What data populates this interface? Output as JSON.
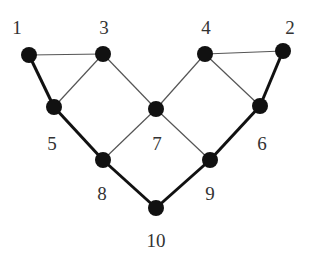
{
  "graph": {
    "nodes": [
      {
        "id": "1",
        "label": "1"
      },
      {
        "id": "2",
        "label": "2"
      },
      {
        "id": "3",
        "label": "3"
      },
      {
        "id": "4",
        "label": "4"
      },
      {
        "id": "5",
        "label": "5"
      },
      {
        "id": "6",
        "label": "6"
      },
      {
        "id": "7",
        "label": "7"
      },
      {
        "id": "8",
        "label": "8"
      },
      {
        "id": "9",
        "label": "9"
      },
      {
        "id": "10",
        "label": "10"
      }
    ],
    "edges": [
      {
        "from": "1",
        "to": "3",
        "style": "thin"
      },
      {
        "from": "3",
        "to": "5",
        "style": "thin"
      },
      {
        "from": "3",
        "to": "7",
        "style": "thin"
      },
      {
        "from": "4",
        "to": "7",
        "style": "thin"
      },
      {
        "from": "4",
        "to": "2",
        "style": "thin"
      },
      {
        "from": "4",
        "to": "6",
        "style": "thin"
      },
      {
        "from": "7",
        "to": "8",
        "style": "thin"
      },
      {
        "from": "7",
        "to": "9",
        "style": "thin"
      },
      {
        "from": "1",
        "to": "5",
        "style": "thick"
      },
      {
        "from": "5",
        "to": "8",
        "style": "thick"
      },
      {
        "from": "8",
        "to": "10",
        "style": "thick"
      },
      {
        "from": "10",
        "to": "9",
        "style": "thick"
      },
      {
        "from": "9",
        "to": "6",
        "style": "thick"
      },
      {
        "from": "6",
        "to": "2",
        "style": "thick"
      }
    ],
    "highlighted_path": [
      "1",
      "5",
      "8",
      "10",
      "9",
      "6",
      "2"
    ]
  }
}
